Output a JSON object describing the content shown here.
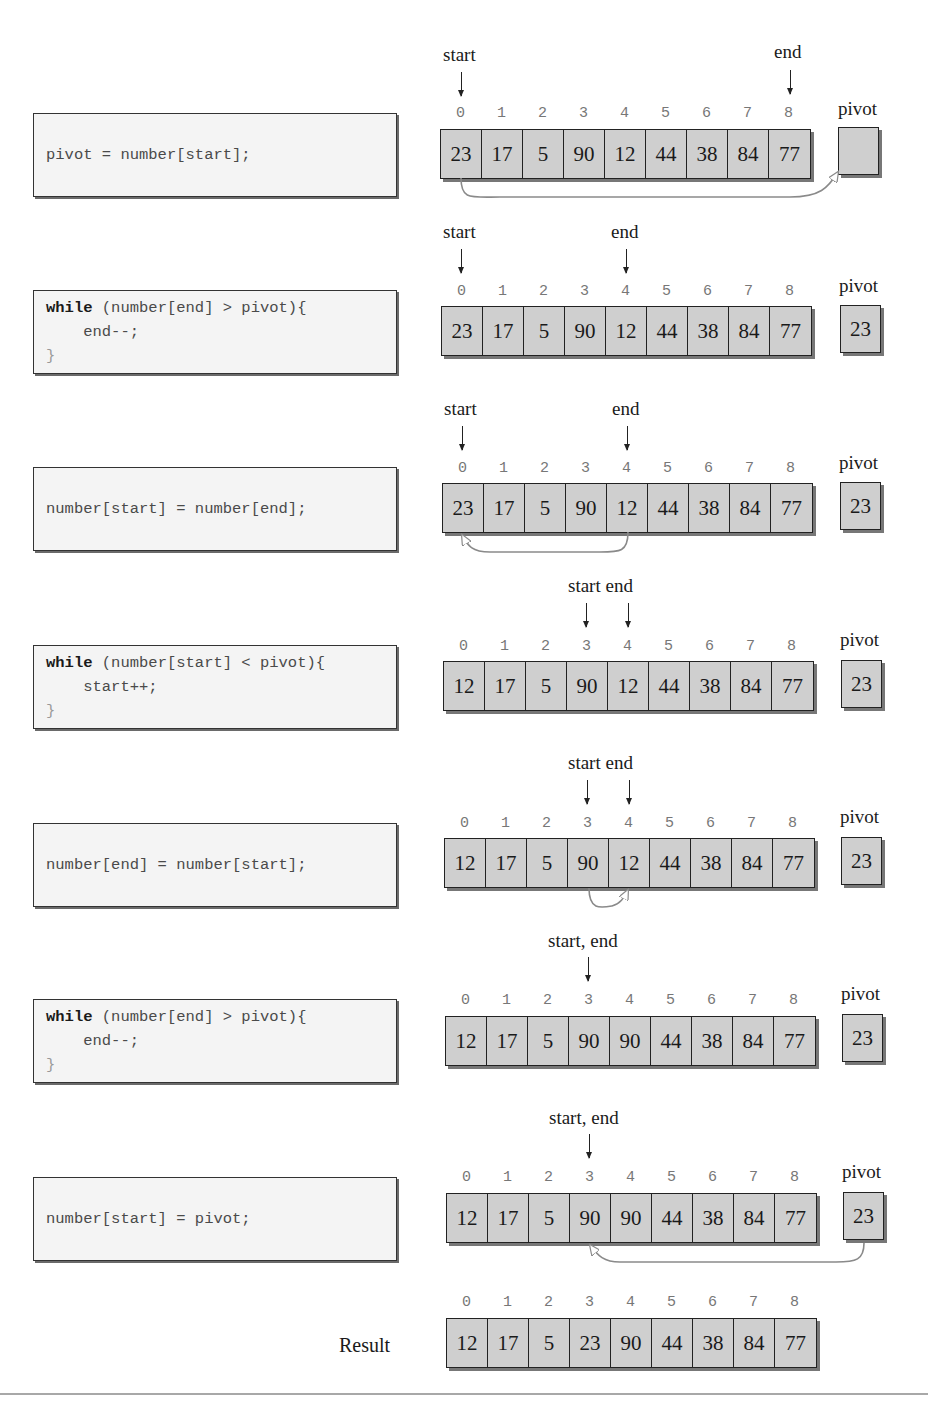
{
  "steps": [
    {
      "code": [
        {
          "kw": "",
          "rest": "pivot = number[start];"
        }
      ],
      "pointers": [
        {
          "label": "start",
          "index": 0
        },
        {
          "label": "end",
          "index": 8
        }
      ],
      "indices": [
        "0",
        "1",
        "2",
        "3",
        "4",
        "5",
        "6",
        "7",
        "8"
      ],
      "values": [
        "23",
        "17",
        "5",
        "90",
        "12",
        "44",
        "38",
        "84",
        "77"
      ],
      "pivot_label": "pivot",
      "pivot_value": "",
      "move": "index 0 -> pivot"
    },
    {
      "code": [
        {
          "kw": "while",
          "rest": " (number[end] > pivot){"
        },
        {
          "kw": "",
          "rest": "    end--;"
        },
        {
          "kw": "",
          "rest": "}"
        }
      ],
      "pointers": [
        {
          "label": "start",
          "index": 0
        },
        {
          "label": "end",
          "index": 4
        }
      ],
      "indices": [
        "0",
        "1",
        "2",
        "3",
        "4",
        "5",
        "6",
        "7",
        "8"
      ],
      "values": [
        "23",
        "17",
        "5",
        "90",
        "12",
        "44",
        "38",
        "84",
        "77"
      ],
      "pivot_label": "pivot",
      "pivot_value": "23"
    },
    {
      "code": [
        {
          "kw": "",
          "rest": "number[start] = number[end];"
        }
      ],
      "pointers": [
        {
          "label": "start",
          "index": 0
        },
        {
          "label": "end",
          "index": 4
        }
      ],
      "indices": [
        "0",
        "1",
        "2",
        "3",
        "4",
        "5",
        "6",
        "7",
        "8"
      ],
      "values": [
        "23",
        "17",
        "5",
        "90",
        "12",
        "44",
        "38",
        "84",
        "77"
      ],
      "pivot_label": "pivot",
      "pivot_value": "23",
      "move": "index 4 -> index 0"
    },
    {
      "code": [
        {
          "kw": "while",
          "rest": " (number[start] < pivot){"
        },
        {
          "kw": "",
          "rest": "    start++;"
        },
        {
          "kw": "",
          "rest": "}"
        }
      ],
      "pointer_text": "start end",
      "pointers": [
        {
          "label": "start",
          "index": 3
        },
        {
          "label": "end",
          "index": 4
        }
      ],
      "indices": [
        "0",
        "1",
        "2",
        "3",
        "4",
        "5",
        "6",
        "7",
        "8"
      ],
      "values": [
        "12",
        "17",
        "5",
        "90",
        "12",
        "44",
        "38",
        "84",
        "77"
      ],
      "pivot_label": "pivot",
      "pivot_value": "23"
    },
    {
      "code": [
        {
          "kw": "",
          "rest": "number[end] = number[start];"
        }
      ],
      "pointer_text": "start end",
      "pointers": [
        {
          "label": "start",
          "index": 3
        },
        {
          "label": "end",
          "index": 4
        }
      ],
      "indices": [
        "0",
        "1",
        "2",
        "3",
        "4",
        "5",
        "6",
        "7",
        "8"
      ],
      "values": [
        "12",
        "17",
        "5",
        "90",
        "12",
        "44",
        "38",
        "84",
        "77"
      ],
      "pivot_label": "pivot",
      "pivot_value": "23",
      "move": "index 3 -> index 4"
    },
    {
      "code": [
        {
          "kw": "while",
          "rest": " (number[end] > pivot){"
        },
        {
          "kw": "",
          "rest": "    end--;"
        },
        {
          "kw": "",
          "rest": "}"
        }
      ],
      "pointer_text": "start, end",
      "pointers": [
        {
          "label": "start, end",
          "index": 3
        }
      ],
      "indices": [
        "0",
        "1",
        "2",
        "3",
        "4",
        "5",
        "6",
        "7",
        "8"
      ],
      "values": [
        "12",
        "17",
        "5",
        "90",
        "90",
        "44",
        "38",
        "84",
        "77"
      ],
      "pivot_label": "pivot",
      "pivot_value": "23"
    },
    {
      "code": [
        {
          "kw": "",
          "rest": "number[start] = pivot;"
        }
      ],
      "pointer_text": "start, end",
      "pointers": [
        {
          "label": "start, end",
          "index": 3
        }
      ],
      "indices": [
        "0",
        "1",
        "2",
        "3",
        "4",
        "5",
        "6",
        "7",
        "8"
      ],
      "values": [
        "12",
        "17",
        "5",
        "90",
        "90",
        "44",
        "38",
        "84",
        "77"
      ],
      "pivot_label": "pivot",
      "pivot_value": "23",
      "move": "pivot -> index 3"
    }
  ],
  "result": {
    "label": "Result",
    "indices": [
      "0",
      "1",
      "2",
      "3",
      "4",
      "5",
      "6",
      "7",
      "8"
    ],
    "values": [
      "12",
      "17",
      "5",
      "23",
      "90",
      "44",
      "38",
      "84",
      "77"
    ]
  },
  "colors": {
    "cell_fill": "#cfcfcf",
    "code_bg": "#f4f4f4",
    "arrow_gray": "#8a8a8a",
    "index_gray": "#777777"
  }
}
